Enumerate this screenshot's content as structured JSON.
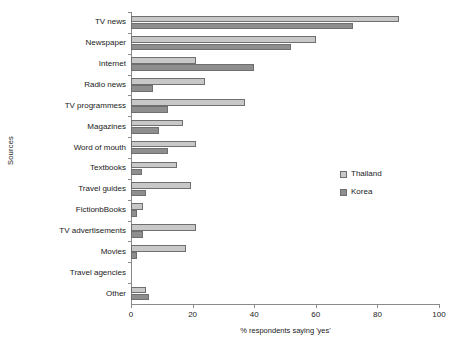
{
  "chart_data": {
    "type": "bar",
    "orientation": "horizontal",
    "title": "",
    "xlabel": "% respondents saying 'yes'",
    "ylabel": "Sources",
    "xlim": [
      0,
      100
    ],
    "xticks": [
      0,
      20,
      40,
      60,
      80,
      100
    ],
    "grid": false,
    "legend_position": "right-middle",
    "categories": [
      "TV news",
      "Newspaper",
      "Internet",
      "Radio news",
      "TV programmess",
      "Magazines",
      "Word of mouth",
      "Textbooks",
      "Travel guides",
      "FictionbBooks",
      "TV advertisements",
      "Movies",
      "Travel agencies",
      "Other"
    ],
    "series": [
      {
        "name": "Thailand",
        "color": "#c8c8c8",
        "values": [
          87,
          60,
          21,
          24,
          37,
          17,
          21,
          15,
          19.5,
          4,
          21,
          18,
          0,
          5
        ]
      },
      {
        "name": "Korea",
        "color": "#8e8e8e",
        "values": [
          72,
          52,
          40,
          7,
          12,
          9,
          12,
          3.5,
          5,
          2,
          4,
          2,
          0,
          6
        ]
      }
    ]
  },
  "legend": {
    "items": [
      {
        "label": "Thailand",
        "swatch": "thailand"
      },
      {
        "label": "Korea",
        "swatch": "korea"
      }
    ]
  },
  "axis": {
    "x_title": "% respondents saying 'yes'",
    "y_title": "Sources",
    "x_tick_labels": [
      "0",
      "20",
      "40",
      "60",
      "80",
      "100"
    ]
  }
}
